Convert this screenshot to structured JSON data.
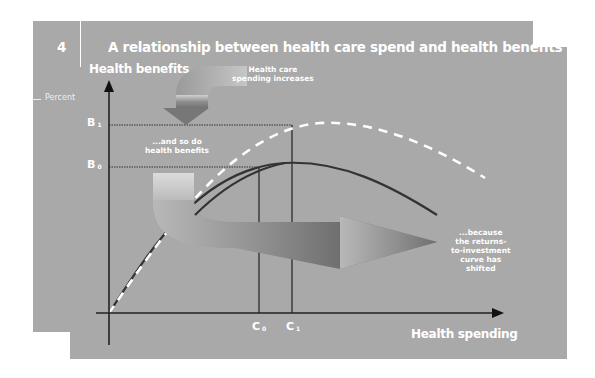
{
  "figure": {
    "number": "4",
    "title": "A relationship between health care spend and health benefits",
    "unit_label": "Percent"
  },
  "axes": {
    "y_label": "Health benefits",
    "x_label": "Health spending",
    "y_ticks": [
      {
        "letter": "B",
        "sub": "1"
      },
      {
        "letter": "B",
        "sub": "0"
      }
    ],
    "x_ticks": [
      {
        "letter": "C",
        "sub": "0"
      },
      {
        "letter": "C",
        "sub": "1"
      }
    ]
  },
  "annotations": {
    "top": [
      "Health care",
      "spending increases"
    ],
    "middle": [
      "...and so do",
      "health benefits"
    ],
    "right": [
      "...because",
      "the returns-",
      "to-investment",
      "curve has",
      "shifted"
    ]
  },
  "curves": [
    {
      "name": "original returns-to-investment curve",
      "style": "solid",
      "color": "#333333"
    },
    {
      "name": "shifted returns-to-investment curve",
      "style": "dashed",
      "color": "#ffffff"
    }
  ],
  "colors": {
    "panel": "#a9a9a9",
    "axis": "#2a2a2a",
    "text": "#ffffff"
  }
}
